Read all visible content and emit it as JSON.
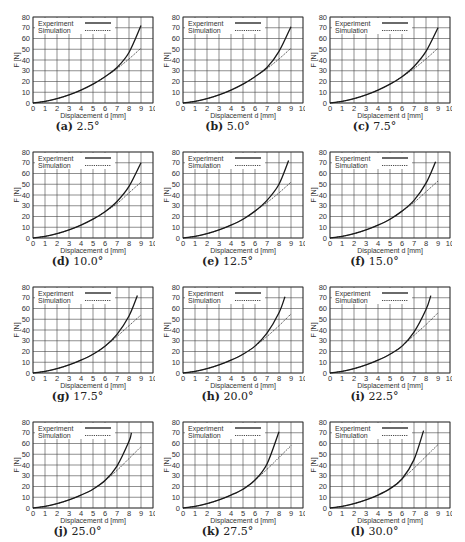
{
  "chart_data": [
    {
      "id": "a",
      "type": "line",
      "caption_label": "(a)",
      "caption_value": "2.5°",
      "title": "(a) 2.5°",
      "xlabel": "Displacement d [mm]",
      "ylabel": "F [N]",
      "xlim": [
        0,
        10
      ],
      "ylim": [
        0,
        80
      ],
      "xticks": [
        0,
        1,
        2,
        3,
        4,
        5,
        6,
        7,
        8,
        9,
        10
      ],
      "yticks": [
        0,
        10,
        20,
        30,
        40,
        50,
        60,
        70,
        80
      ],
      "grid": true,
      "legend": [
        "Experiment",
        "Simulation"
      ],
      "legend_position": "upper left",
      "series": [
        {
          "name": "Experiment",
          "style": "solid",
          "x": [
            0,
            1,
            2,
            3,
            4,
            5,
            6,
            7,
            8,
            9
          ],
          "y": [
            0,
            1.5,
            4,
            7.5,
            12,
            17.5,
            24.5,
            33,
            47,
            72
          ]
        },
        {
          "name": "Simulation",
          "style": "dotted",
          "x": [
            0,
            1,
            2,
            3,
            4,
            5,
            6,
            7,
            8,
            9
          ],
          "y": [
            0,
            1.5,
            4,
            7.5,
            12,
            17.5,
            24.5,
            32,
            41,
            51
          ]
        }
      ]
    },
    {
      "id": "b",
      "type": "line",
      "caption_label": "(b)",
      "caption_value": "5.0°",
      "title": "(b) 5.0°",
      "xlabel": "Displacement d [mm]",
      "ylabel": "F [N]",
      "xlim": [
        0,
        10
      ],
      "ylim": [
        0,
        80
      ],
      "xticks": [
        0,
        1,
        2,
        3,
        4,
        5,
        6,
        7,
        8,
        9,
        10
      ],
      "yticks": [
        0,
        10,
        20,
        30,
        40,
        50,
        60,
        70,
        80
      ],
      "grid": true,
      "legend": [
        "Experiment",
        "Simulation"
      ],
      "legend_position": "upper left",
      "series": [
        {
          "name": "Experiment",
          "style": "solid",
          "x": [
            0,
            1,
            2,
            3,
            4,
            5,
            6,
            7,
            8,
            9
          ],
          "y": [
            0,
            1.5,
            4,
            7.5,
            12,
            17.5,
            24.5,
            33,
            48,
            71
          ]
        },
        {
          "name": "Simulation",
          "style": "dotted",
          "x": [
            0,
            1,
            2,
            3,
            4,
            5,
            6,
            7,
            8,
            9
          ],
          "y": [
            0,
            1.5,
            4,
            7.5,
            12,
            17.5,
            24.5,
            32,
            41,
            51
          ]
        }
      ]
    },
    {
      "id": "c",
      "type": "line",
      "caption_label": "(c)",
      "caption_value": "7.5°",
      "title": "(c) 7.5°",
      "xlabel": "Displacement d [mm]",
      "ylabel": "F [N]",
      "xlim": [
        0,
        10
      ],
      "ylim": [
        0,
        80
      ],
      "xticks": [
        0,
        1,
        2,
        3,
        4,
        5,
        6,
        7,
        8,
        9,
        10
      ],
      "yticks": [
        0,
        10,
        20,
        30,
        40,
        50,
        60,
        70,
        80
      ],
      "grid": true,
      "legend": [
        "Experiment",
        "Simulation"
      ],
      "legend_position": "upper left",
      "series": [
        {
          "name": "Experiment",
          "style": "solid",
          "x": [
            0,
            1,
            2,
            3,
            4,
            5,
            6,
            7,
            8,
            9
          ],
          "y": [
            0,
            1.5,
            4,
            7.5,
            12,
            17.5,
            24.5,
            34,
            48,
            70
          ]
        },
        {
          "name": "Simulation",
          "style": "dotted",
          "x": [
            0,
            1,
            2,
            3,
            4,
            5,
            6,
            7,
            8,
            9
          ],
          "y": [
            0,
            1.5,
            4,
            7.5,
            12,
            17.5,
            24.5,
            32,
            41,
            51
          ]
        }
      ]
    },
    {
      "id": "d",
      "type": "line",
      "caption_label": "(d)",
      "caption_value": "10.0°",
      "title": "(d) 10.0°",
      "xlabel": "Displacement d [mm]",
      "ylabel": "F [N]",
      "xlim": [
        0,
        10
      ],
      "ylim": [
        0,
        80
      ],
      "xticks": [
        0,
        1,
        2,
        3,
        4,
        5,
        6,
        7,
        8,
        9,
        10
      ],
      "yticks": [
        0,
        10,
        20,
        30,
        40,
        50,
        60,
        70,
        80
      ],
      "grid": true,
      "legend": [
        "Experiment",
        "Simulation"
      ],
      "legend_position": "upper left",
      "series": [
        {
          "name": "Experiment",
          "style": "solid",
          "x": [
            0,
            1,
            2,
            3,
            4,
            5,
            6,
            7,
            8,
            9
          ],
          "y": [
            0,
            1.5,
            4,
            7.5,
            12,
            17.5,
            24.5,
            34,
            48,
            70
          ]
        },
        {
          "name": "Simulation",
          "style": "dotted",
          "x": [
            0,
            1,
            2,
            3,
            4,
            5,
            6,
            7,
            8,
            9
          ],
          "y": [
            0,
            1.5,
            4,
            7.5,
            12,
            17.5,
            24.5,
            32,
            42,
            52
          ]
        }
      ]
    },
    {
      "id": "e",
      "type": "line",
      "caption_label": "(e)",
      "caption_value": "12.5°",
      "title": "(e) 12.5°",
      "xlabel": "Displacement d [mm]",
      "ylabel": "F [N]",
      "xlim": [
        0,
        10
      ],
      "ylim": [
        0,
        80
      ],
      "xticks": [
        0,
        1,
        2,
        3,
        4,
        5,
        6,
        7,
        8,
        9,
        10
      ],
      "yticks": [
        0,
        10,
        20,
        30,
        40,
        50,
        60,
        70,
        80
      ],
      "grid": true,
      "legend": [
        "Experiment",
        "Simulation"
      ],
      "legend_position": "upper left",
      "series": [
        {
          "name": "Experiment",
          "style": "solid",
          "x": [
            0,
            1,
            2,
            3,
            4,
            5,
            6,
            7,
            8,
            8.8
          ],
          "y": [
            0,
            1.5,
            4,
            7.5,
            12,
            17.5,
            25,
            35,
            50,
            72
          ]
        },
        {
          "name": "Simulation",
          "style": "dotted",
          "x": [
            0,
            1,
            2,
            3,
            4,
            5,
            6,
            7,
            8,
            9
          ],
          "y": [
            0,
            1.5,
            4,
            7.5,
            12,
            17.5,
            25,
            33,
            42,
            52
          ]
        }
      ]
    },
    {
      "id": "f",
      "type": "line",
      "caption_label": "(f)",
      "caption_value": "15.0°",
      "title": "(f) 15.0°",
      "xlabel": "Displacement d [mm]",
      "ylabel": "F [N]",
      "xlim": [
        0,
        10
      ],
      "ylim": [
        0,
        80
      ],
      "xticks": [
        0,
        1,
        2,
        3,
        4,
        5,
        6,
        7,
        8,
        9,
        10
      ],
      "yticks": [
        0,
        10,
        20,
        30,
        40,
        50,
        60,
        70,
        80
      ],
      "grid": true,
      "legend": [
        "Experiment",
        "Simulation"
      ],
      "legend_position": "upper left",
      "series": [
        {
          "name": "Experiment",
          "style": "solid",
          "x": [
            0,
            1,
            2,
            3,
            4,
            5,
            6,
            7,
            8,
            8.8
          ],
          "y": [
            0,
            1.5,
            4,
            7.5,
            12,
            17.5,
            25,
            35,
            51,
            71
          ]
        },
        {
          "name": "Simulation",
          "style": "dotted",
          "x": [
            0,
            1,
            2,
            3,
            4,
            5,
            6,
            7,
            8,
            9
          ],
          "y": [
            0,
            1.5,
            4,
            7.5,
            12,
            17.5,
            25,
            33,
            43,
            53
          ]
        }
      ]
    },
    {
      "id": "g",
      "type": "line",
      "caption_label": "(g)",
      "caption_value": "17.5°",
      "title": "(g) 17.5°",
      "xlabel": "Displacement d [mm]",
      "ylabel": "F [N]",
      "xlim": [
        0,
        10
      ],
      "ylim": [
        0,
        80
      ],
      "xticks": [
        0,
        1,
        2,
        3,
        4,
        5,
        6,
        7,
        8,
        9,
        10
      ],
      "yticks": [
        0,
        10,
        20,
        30,
        40,
        50,
        60,
        70,
        80
      ],
      "grid": true,
      "legend": [
        "Experiment",
        "Simulation"
      ],
      "legend_position": "upper left",
      "series": [
        {
          "name": "Experiment",
          "style": "solid",
          "x": [
            0,
            1,
            2,
            3,
            4,
            5,
            6,
            7,
            8,
            8.7
          ],
          "y": [
            0,
            1.5,
            4,
            7.5,
            12,
            17.5,
            25,
            36,
            53,
            72
          ]
        },
        {
          "name": "Simulation",
          "style": "dotted",
          "x": [
            0,
            1,
            2,
            3,
            4,
            5,
            6,
            7,
            8,
            9
          ],
          "y": [
            0,
            1.5,
            4,
            7.5,
            12,
            17.5,
            25,
            34,
            44,
            54
          ]
        }
      ]
    },
    {
      "id": "h",
      "type": "line",
      "caption_label": "(h)",
      "caption_value": "20.0°",
      "title": "(h) 20.0°",
      "xlabel": "Displacement d [mm]",
      "ylabel": "F [N]",
      "xlim": [
        0,
        10
      ],
      "ylim": [
        0,
        80
      ],
      "xticks": [
        0,
        1,
        2,
        3,
        4,
        5,
        6,
        7,
        8,
        9,
        10
      ],
      "yticks": [
        0,
        10,
        20,
        30,
        40,
        50,
        60,
        70,
        80
      ],
      "grid": true,
      "legend": [
        "Experiment",
        "Simulation"
      ],
      "legend_position": "upper left",
      "series": [
        {
          "name": "Experiment",
          "style": "solid",
          "x": [
            0,
            1,
            2,
            3,
            4,
            5,
            6,
            7,
            8,
            8.5
          ],
          "y": [
            0,
            1.5,
            4,
            7.5,
            12,
            17.5,
            25,
            37,
            56,
            71
          ]
        },
        {
          "name": "Simulation",
          "style": "dotted",
          "x": [
            0,
            1,
            2,
            3,
            4,
            5,
            6,
            7,
            8,
            9
          ],
          "y": [
            0,
            1.5,
            4,
            7.5,
            12,
            17.5,
            25,
            34,
            44,
            55
          ]
        }
      ]
    },
    {
      "id": "i",
      "type": "line",
      "caption_label": "(i)",
      "caption_value": "22.5°",
      "title": "(i) 22.5°",
      "xlabel": "Displacement d [mm]",
      "ylabel": "F [N]",
      "xlim": [
        0,
        10
      ],
      "ylim": [
        0,
        80
      ],
      "xticks": [
        0,
        1,
        2,
        3,
        4,
        5,
        6,
        7,
        8,
        9,
        10
      ],
      "yticks": [
        0,
        10,
        20,
        30,
        40,
        50,
        60,
        70,
        80
      ],
      "grid": true,
      "legend": [
        "Experiment",
        "Simulation"
      ],
      "legend_position": "upper left",
      "series": [
        {
          "name": "Experiment",
          "style": "solid",
          "x": [
            0,
            1,
            2,
            3,
            4,
            5,
            6,
            7,
            8,
            8.4
          ],
          "y": [
            0,
            1.5,
            4,
            7.5,
            12,
            17.5,
            25,
            38,
            59,
            72
          ]
        },
        {
          "name": "Simulation",
          "style": "dotted",
          "x": [
            0,
            1,
            2,
            3,
            4,
            5,
            6,
            7,
            8,
            9
          ],
          "y": [
            0,
            1.5,
            4,
            7.5,
            12,
            17.5,
            25,
            35,
            45,
            56
          ]
        }
      ]
    },
    {
      "id": "j",
      "type": "line",
      "caption_label": "(j)",
      "caption_value": "25.0°",
      "title": "(j) 25.0°",
      "xlabel": "Displacement d [mm]",
      "ylabel": "F [N]",
      "xlim": [
        0,
        10
      ],
      "ylim": [
        0,
        80
      ],
      "xticks": [
        0,
        1,
        2,
        3,
        4,
        5,
        6,
        7,
        8,
        9,
        10
      ],
      "yticks": [
        0,
        10,
        20,
        30,
        40,
        50,
        60,
        70,
        80
      ],
      "grid": true,
      "legend": [
        "Experiment",
        "Simulation"
      ],
      "legend_position": "upper left",
      "series": [
        {
          "name": "Experiment",
          "style": "solid",
          "x": [
            0,
            1,
            2,
            3,
            4,
            5,
            6,
            7,
            8,
            8.2
          ],
          "y": [
            0,
            1.5,
            4,
            7.5,
            12,
            17.5,
            25.5,
            39,
            62,
            70
          ]
        },
        {
          "name": "Simulation",
          "style": "dotted",
          "x": [
            0,
            1,
            2,
            3,
            4,
            5,
            6,
            7,
            8,
            9
          ],
          "y": [
            0,
            1.5,
            4,
            7.5,
            12,
            17.5,
            25.5,
            35,
            46,
            57
          ]
        }
      ]
    },
    {
      "id": "k",
      "type": "line",
      "caption_label": "(k)",
      "caption_value": "27.5°",
      "title": "(k) 27.5°",
      "xlabel": "Displacement d [mm]",
      "ylabel": "F [N]",
      "xlim": [
        0,
        10
      ],
      "ylim": [
        0,
        80
      ],
      "xticks": [
        0,
        1,
        2,
        3,
        4,
        5,
        6,
        7,
        8,
        9,
        10
      ],
      "yticks": [
        0,
        10,
        20,
        30,
        40,
        50,
        60,
        70,
        80
      ],
      "grid": true,
      "legend": [
        "Experiment",
        "Simulation"
      ],
      "legend_position": "upper left",
      "series": [
        {
          "name": "Experiment",
          "style": "solid",
          "x": [
            0,
            1,
            2,
            3,
            4,
            5,
            6,
            7,
            8
          ],
          "y": [
            0,
            1.5,
            4,
            7.5,
            12,
            17.5,
            26,
            41,
            71
          ]
        },
        {
          "name": "Simulation",
          "style": "dotted",
          "x": [
            0,
            1,
            2,
            3,
            4,
            5,
            6,
            7,
            8,
            9
          ],
          "y": [
            0,
            1.5,
            4,
            7.5,
            12,
            17.5,
            26,
            36,
            47,
            58
          ]
        }
      ]
    },
    {
      "id": "l",
      "type": "line",
      "caption_label": "(l)",
      "caption_value": "30.0°",
      "title": "(l) 30.0°",
      "xlabel": "Displacement d [mm]",
      "ylabel": "F [N]",
      "xlim": [
        0,
        10
      ],
      "ylim": [
        0,
        80
      ],
      "xticks": [
        0,
        1,
        2,
        3,
        4,
        5,
        6,
        7,
        8,
        9,
        10
      ],
      "yticks": [
        0,
        10,
        20,
        30,
        40,
        50,
        60,
        70,
        80
      ],
      "grid": true,
      "legend": [
        "Experiment",
        "Simulation"
      ],
      "legend_position": "upper left",
      "series": [
        {
          "name": "Experiment",
          "style": "solid",
          "x": [
            0,
            1,
            2,
            3,
            4,
            5,
            6,
            7,
            7.8
          ],
          "y": [
            0,
            1.5,
            4,
            7.5,
            12,
            18,
            27,
            45,
            72
          ]
        },
        {
          "name": "Simulation",
          "style": "dotted",
          "x": [
            0,
            1,
            2,
            3,
            4,
            5,
            6,
            7,
            8,
            9
          ],
          "y": [
            0,
            1.5,
            4,
            7.5,
            12,
            18,
            27,
            37,
            48,
            59
          ]
        }
      ]
    }
  ],
  "style": {
    "line_color": "#1a1a1a",
    "grid_color": "#444444",
    "text_color": "#333333"
  }
}
